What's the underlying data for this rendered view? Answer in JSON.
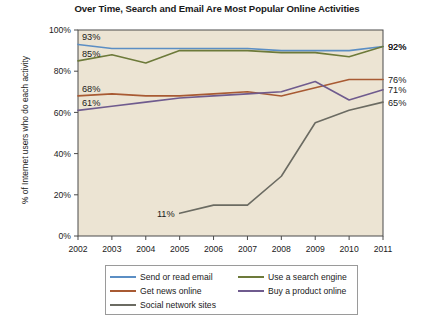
{
  "chart_data": {
    "type": "line",
    "title": "Over Time, Search and Email Are Most Popular Online Activities",
    "xlabel": "",
    "ylabel": "% of Internet users who do each activity",
    "x": [
      2002,
      2003,
      2004,
      2005,
      2006,
      2007,
      2008,
      2009,
      2010,
      2011
    ],
    "categories": [
      "2002",
      "2003",
      "2004",
      "2005",
      "2006",
      "2007",
      "2008",
      "2009",
      "2010",
      "2011"
    ],
    "ylim": [
      0,
      100
    ],
    "yticks": [
      0,
      20,
      40,
      60,
      80,
      100
    ],
    "ytick_labels": [
      "0%",
      "20%",
      "40%",
      "60%",
      "80%",
      "100%"
    ],
    "grid": false,
    "legend_position": "bottom",
    "series": [
      {
        "name": "Send or read email",
        "color": "#5b8ec4",
        "values": [
          93,
          91,
          91,
          91,
          91,
          91,
          90,
          90,
          90,
          92
        ],
        "start_label": "93%",
        "end_label": "92%"
      },
      {
        "name": "Use a search engine",
        "color": "#6d7a3a",
        "values": [
          85,
          88,
          84,
          90,
          90,
          90,
          89,
          89,
          87,
          92
        ],
        "start_label": "85%",
        "end_label": "92%"
      },
      {
        "name": "Get news online",
        "color": "#a85a33",
        "values": [
          68,
          69,
          68,
          68,
          69,
          70,
          68,
          72,
          76,
          76
        ],
        "start_label": "68%",
        "end_label": "76%"
      },
      {
        "name": "Buy a product online",
        "color": "#6f5b8e",
        "values": [
          61,
          63,
          65,
          67,
          68,
          69,
          70,
          75,
          66,
          71
        ],
        "start_label": "61%",
        "end_label": "71%"
      },
      {
        "name": "Social network sites",
        "color": "#6b6b62",
        "values": [
          null,
          null,
          null,
          11,
          15,
          15,
          29,
          55,
          61,
          65
        ],
        "start_label": "11%",
        "end_label": "65%"
      }
    ]
  },
  "legend": {
    "items": [
      {
        "label": "Send or read email",
        "color": "#5b8ec4"
      },
      {
        "label": "Use a search engine",
        "color": "#6d7a3a"
      },
      {
        "label": "Get news online",
        "color": "#a85a33"
      },
      {
        "label": "Buy a product online",
        "color": "#6f5b8e"
      },
      {
        "label": "Social network sites",
        "color": "#6b6b62"
      }
    ]
  },
  "style": {
    "plot_background": "#ece4d3",
    "page_background": "#ffffff",
    "axis_color": "#4a4a4a",
    "text_color": "#1a1a1a"
  }
}
